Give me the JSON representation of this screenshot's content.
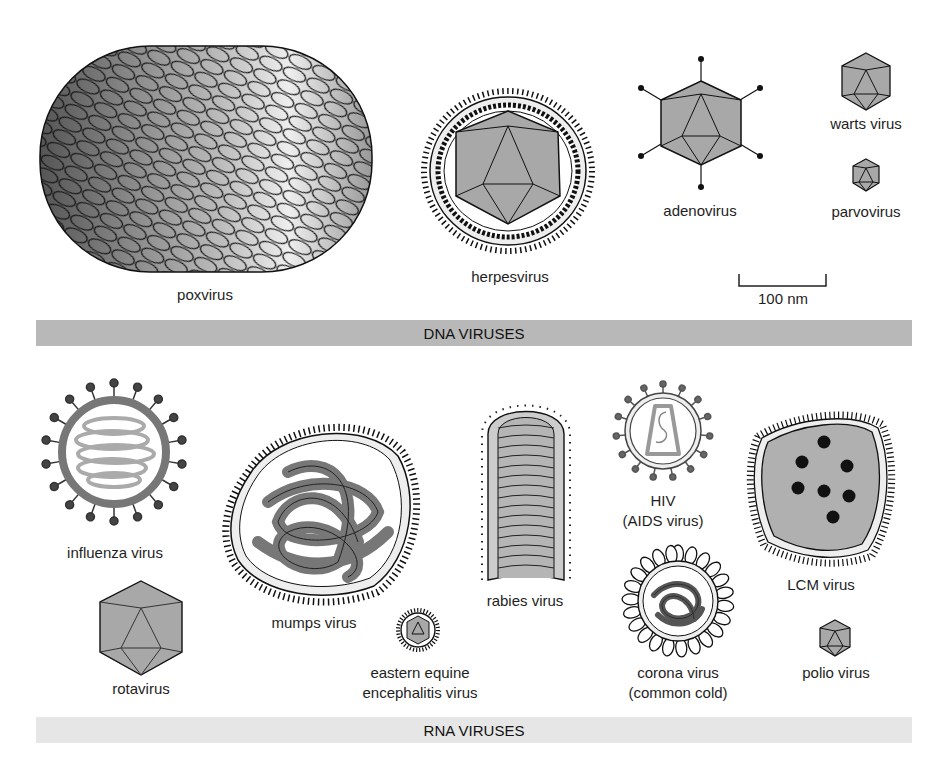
{
  "colors": {
    "capsid_fill": "#a8a8a8",
    "outline": "#1a1a1a",
    "dna_band": "#b8b8b8",
    "rna_band": "#e6e6e6"
  },
  "sections": {
    "dna": {
      "label": "DNA VIRUSES"
    },
    "rna": {
      "label": "RNA VIRUSES"
    }
  },
  "scale_bar": {
    "label": "100 nm"
  },
  "dna_viruses": [
    {
      "name": "poxvirus"
    },
    {
      "name": "herpesvirus"
    },
    {
      "name": "adenovirus"
    },
    {
      "name": "warts virus"
    },
    {
      "name": "parvovirus"
    }
  ],
  "rna_viruses": [
    {
      "name": "influenza virus"
    },
    {
      "name": "rotavirus"
    },
    {
      "name": "mumps virus"
    },
    {
      "name": "eastern equine",
      "name2": "encephalitis virus"
    },
    {
      "name": "rabies virus"
    },
    {
      "name": "HIV",
      "name2": "(AIDS virus)"
    },
    {
      "name": "corona virus",
      "name2": "(common cold)"
    },
    {
      "name": "LCM virus"
    },
    {
      "name": "polio virus"
    }
  ]
}
